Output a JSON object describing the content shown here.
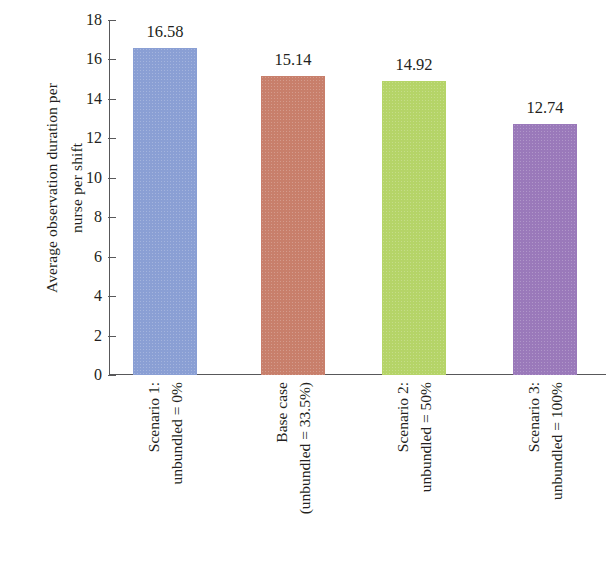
{
  "chart_data": {
    "type": "bar",
    "title": "",
    "xlabel": "",
    "ylabel": "Average observation duration per nurse per shift",
    "ylabel_lines": [
      "Average observation duration per",
      "nurse per shift"
    ],
    "categories": [
      "Scenario 1: unbundled = 0%",
      "Base case (unbundled = 33.5%)",
      "Scenario 2: unbundled = 50%",
      "Scenario 3: unbundled = 100%"
    ],
    "category_lines": [
      [
        "Scenario 1:",
        "unbundled = 0%"
      ],
      [
        "Base case",
        "(unbundled = 33.5%)"
      ],
      [
        "Scenario 2:",
        "unbundled = 50%"
      ],
      [
        "Scenario 3:",
        "unbundled = 100%"
      ]
    ],
    "values": [
      16.58,
      15.14,
      14.92,
      12.74
    ],
    "value_labels": [
      "16.58",
      "15.14",
      "14.92",
      "12.74"
    ],
    "colors": [
      "#8a9fd4",
      "#c87f6b",
      "#b5d468",
      "#9a79ba"
    ],
    "ylim": [
      0,
      18
    ],
    "ytick_step": 2,
    "ytick_labels": [
      "18",
      "16",
      "14",
      "12",
      "10",
      "8",
      "6",
      "4",
      "2",
      "0"
    ],
    "ytick_values": [
      18,
      16,
      14,
      12,
      10,
      8,
      6,
      4,
      2,
      0
    ],
    "grid": false,
    "legend": null,
    "legend_position": "none",
    "axis_color": "#58585a",
    "text_color": "#231f20",
    "background": "#ffffff"
  }
}
